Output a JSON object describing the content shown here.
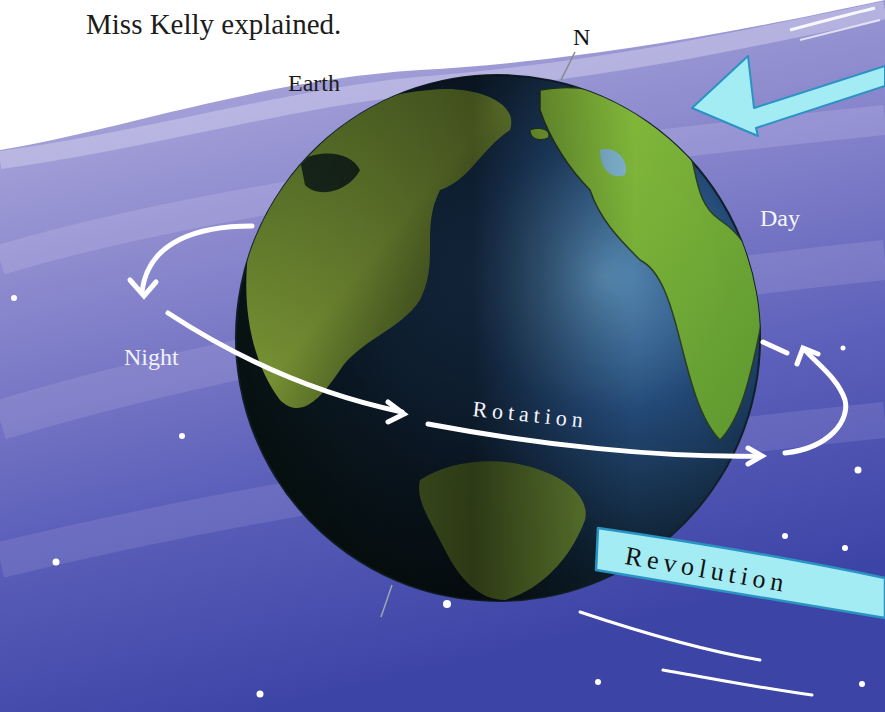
{
  "page": {
    "caption": "Miss Kelly explained."
  },
  "labels": {
    "earth": "Earth",
    "north": "N",
    "day": "Day",
    "night": "Night",
    "rotation": "Rotation",
    "revolution": "Revolution"
  },
  "colors": {
    "space_light": "#a9a6d8",
    "space_mid": "#6e6cc0",
    "space_dark": "#3f45a8",
    "earth_ocean_dark": "#0d1c22",
    "earth_ocean_day": "#2f5d8c",
    "earth_ocean_light": "#7fb3cf",
    "land_dark": "#3d5a1f",
    "land_light": "#8fbf3a",
    "arrow_cyan": "#9fe6f0",
    "arrow_outline": "#2a8fc0",
    "white_arrow": "#ffffff"
  },
  "icons": {
    "rotation_arrow": "curved-arrow",
    "revolution_arrow": "wide-arrow",
    "stars": "star-sparkle"
  }
}
